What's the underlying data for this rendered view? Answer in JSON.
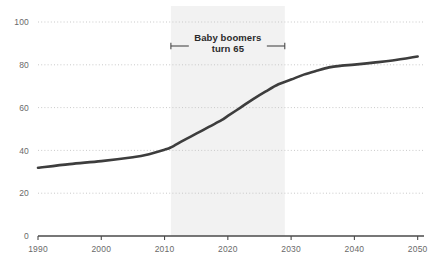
{
  "chart_data": {
    "type": "line",
    "title": "",
    "subtitle": "",
    "xlabel": "",
    "ylabel": "",
    "xlim": [
      1990,
      2051
    ],
    "ylim": [
      0,
      100
    ],
    "grid": true,
    "legend": null,
    "x_ticks": [
      "1990",
      "2000",
      "2010",
      "2020",
      "2030",
      "2040",
      "2050"
    ],
    "x_tick_values": [
      1990,
      2000,
      2010,
      2020,
      2030,
      2040,
      2050
    ],
    "y_ticks": [
      "0",
      "20",
      "40",
      "60",
      "80",
      "100"
    ],
    "y_tick_values": [
      0,
      20,
      40,
      60,
      80,
      100
    ],
    "series": [
      {
        "name": "Population 65 and over",
        "color": "#3d3d3d",
        "x": [
          1990,
          1995,
          2000,
          2005,
          2007,
          2010,
          2011,
          2013,
          2015,
          2017,
          2019,
          2020,
          2022,
          2024,
          2026,
          2028,
          2030,
          2032,
          2034,
          2036,
          2038,
          2040,
          2043,
          2046,
          2050
        ],
        "values": [
          31.9,
          33.6,
          35.0,
          36.8,
          37.8,
          40.3,
          41.4,
          44.7,
          47.8,
          51.0,
          54.1,
          56.1,
          60.0,
          64.0,
          67.6,
          70.9,
          73.1,
          75.4,
          77.2,
          78.8,
          79.6,
          80.1,
          81.0,
          82.0,
          83.9
        ]
      }
    ],
    "shaded_band": {
      "label": "baby-boomer-band",
      "x_start": 2011,
      "x_end": 2029,
      "color": "#f2f2f2"
    },
    "annotations": [
      {
        "name": "baby-boomers-annotation",
        "line1": "Baby boomers",
        "line2": "turn 65",
        "x_start": 2011,
        "x_end": 2029
      }
    ]
  },
  "style": {
    "gridline_color": "#c9c9c9",
    "axis_color": "#4a4a4a",
    "tick_text_color": "#6a6a6a",
    "annotation_text_color": "#2b2b2b",
    "bracket_color": "#4a4a4a",
    "background": "#ffffff"
  }
}
